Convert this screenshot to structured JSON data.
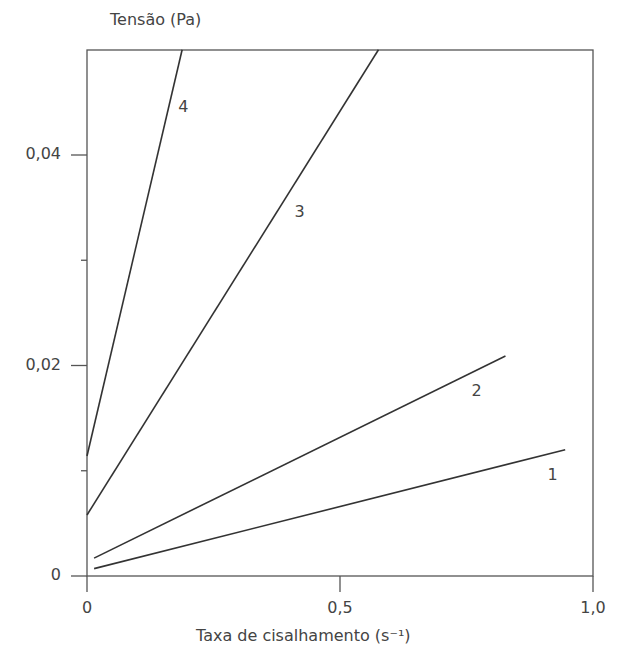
{
  "chart_data": {
    "type": "line",
    "title": "",
    "xlabel": "Taxa de cisalhamento (s⁻¹)",
    "ylabel": "Tensão (Pa)",
    "xlim": [
      0,
      1.0
    ],
    "ylim": [
      0,
      0.05
    ],
    "x_ticks": [
      "0",
      "0,5",
      "1,0"
    ],
    "x_tick_values": [
      0,
      0.5,
      1.0
    ],
    "y_ticks": [
      "0",
      "0,02",
      "0,04"
    ],
    "y_tick_values": [
      0,
      0.02,
      0.04
    ],
    "y_minor_ticks": [
      0.01,
      0.03
    ],
    "grid": false,
    "legend": "inline numeric labels",
    "series": [
      {
        "name": "1",
        "x": [
          0.014,
          0.945
        ],
        "y": [
          0.0007,
          0.012
        ],
        "label_pos": [
          0.92,
          0.0095
        ]
      },
      {
        "name": "2",
        "x": [
          0.014,
          0.827
        ],
        "y": [
          0.0017,
          0.0209
        ],
        "label_pos": [
          0.77,
          0.0175
        ]
      },
      {
        "name": "3",
        "x": [
          0.0,
          0.576
        ],
        "y": [
          0.0058,
          0.05
        ],
        "label_pos": [
          0.42,
          0.0345
        ]
      },
      {
        "name": "4",
        "x": [
          0.0,
          0.188
        ],
        "y": [
          0.0114,
          0.05
        ],
        "label_pos": [
          0.19,
          0.0445
        ]
      }
    ]
  }
}
